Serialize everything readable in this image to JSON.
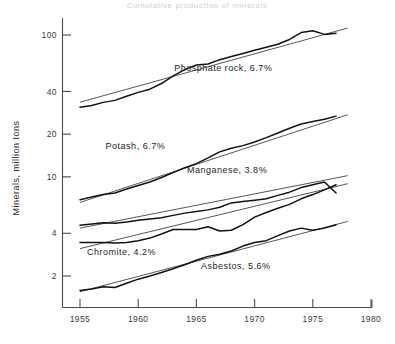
{
  "chart_data": {
    "type": "line",
    "title": "Cumulative production of minerals",
    "xlabel": "",
    "ylabel": "Minerals, million tons",
    "yscale": "log",
    "xlim": [
      1953.8,
      1980
    ],
    "ylim": [
      1.45,
      135
    ],
    "grid": false,
    "legend_position": "inline-annotations",
    "x_ticks": [
      1955,
      1960,
      1965,
      1970,
      1975,
      1980
    ],
    "x_tick_labels": [
      "1955",
      "1960",
      "1965",
      "1970",
      "1975",
      "1980"
    ],
    "y_ticks": [
      2,
      4,
      10,
      20,
      40,
      100
    ],
    "y_tick_labels": [
      "2",
      "4",
      "10",
      "20",
      "40",
      "100"
    ],
    "series": [
      {
        "name": "Phosphate rock",
        "growth_rate": "6.7%",
        "label": "Phosphate rock, 6.7%",
        "label_x": 1963.1,
        "label_y": 56,
        "x": [
          1955,
          1956,
          1957,
          1958,
          1959,
          1960,
          1961,
          1962,
          1963,
          1964,
          1965,
          1966,
          1967,
          1968,
          1969,
          1970,
          1971,
          1972,
          1973,
          1974,
          1975,
          1976,
          1977
        ],
        "y": [
          31.0,
          31.8,
          33.5,
          34.6,
          37.0,
          39.4,
          41.5,
          45.5,
          51.5,
          57.0,
          61.5,
          62.5,
          67.0,
          70.5,
          74.0,
          78.0,
          82.0,
          86.0,
          93.0,
          104.0,
          107.0,
          101.0,
          103.0
        ],
        "trend_x": [
          1955,
          1978
        ],
        "trend_y": [
          33.6,
          112.0
        ]
      },
      {
        "name": "Potash",
        "growth_rate": "6.7%",
        "label": "Potash, 6.7%",
        "label_x": 1957.2,
        "label_y": 15.6,
        "x": [
          1955,
          1956,
          1957,
          1958,
          1959,
          1960,
          1961,
          1962,
          1963,
          1964,
          1965,
          1966,
          1967,
          1968,
          1969,
          1970,
          1971,
          1972,
          1973,
          1974,
          1975,
          1976,
          1977
        ],
        "y": [
          6.9,
          7.2,
          7.5,
          7.7,
          8.2,
          8.7,
          9.2,
          9.9,
          10.7,
          11.6,
          12.4,
          13.6,
          15.0,
          15.9,
          16.6,
          17.6,
          18.9,
          20.4,
          22.0,
          23.6,
          24.6,
          25.5,
          26.8
        ],
        "trend_x": [
          1955,
          1978
        ],
        "trend_y": [
          6.6,
          27.4
        ]
      },
      {
        "name": "Manganese",
        "growth_rate": "3.8%",
        "label": "Manganese, 3.8%",
        "label_x": 1964.2,
        "label_y": 10.6,
        "x": [
          1955,
          1956,
          1957,
          1958,
          1959,
          1960,
          1961,
          1962,
          1963,
          1964,
          1965,
          1966,
          1967,
          1968,
          1969,
          1970,
          1971,
          1972,
          1973,
          1974,
          1975,
          1976,
          1977
        ],
        "y": [
          4.55,
          4.65,
          4.75,
          4.7,
          4.8,
          4.95,
          5.05,
          5.15,
          5.35,
          5.55,
          5.7,
          5.85,
          6.1,
          6.55,
          6.7,
          6.85,
          7.0,
          7.4,
          7.8,
          8.4,
          8.8,
          9.2,
          7.7
        ],
        "trend_x": [
          1955,
          1978
        ],
        "trend_y": [
          4.35,
          10.2
        ]
      },
      {
        "name": "Chromite",
        "growth_rate": "4.2%",
        "label": "Chromite, 4.2%",
        "label_x": 1955.6,
        "label_y": 2.82,
        "x": [
          1955,
          1956,
          1957,
          1958,
          1959,
          1960,
          1961,
          1962,
          1963,
          1964,
          1965,
          1966,
          1967,
          1968,
          1969,
          1970,
          1971,
          1972,
          1973,
          1974,
          1975,
          1976,
          1977
        ],
        "y": [
          3.45,
          3.45,
          3.45,
          3.42,
          3.45,
          3.55,
          3.7,
          3.95,
          4.25,
          4.25,
          4.25,
          4.45,
          4.15,
          4.2,
          4.6,
          5.2,
          5.6,
          6.0,
          6.4,
          7.0,
          7.5,
          8.1,
          8.8
        ],
        "trend_x": [
          1955,
          1978
        ],
        "trend_y": [
          3.12,
          8.95
        ]
      },
      {
        "name": "Asbestos",
        "growth_rate": "5.6%",
        "label": "Asbestos, 5.6%",
        "label_x": 1965.4,
        "label_y": 2.25,
        "x": [
          1955,
          1956,
          1957,
          1958,
          1959,
          1960,
          1961,
          1962,
          1963,
          1964,
          1965,
          1966,
          1967,
          1968,
          1969,
          1970,
          1971,
          1972,
          1973,
          1974,
          1975,
          1976,
          1977
        ],
        "y": [
          1.58,
          1.62,
          1.68,
          1.66,
          1.78,
          1.9,
          2.0,
          2.12,
          2.25,
          2.4,
          2.58,
          2.75,
          2.85,
          3.0,
          3.25,
          3.45,
          3.55,
          3.85,
          4.15,
          4.35,
          4.2,
          4.35,
          4.6
        ],
        "trend_x": [
          1955,
          1978
        ],
        "trend_y": [
          1.55,
          4.85
        ]
      }
    ]
  }
}
